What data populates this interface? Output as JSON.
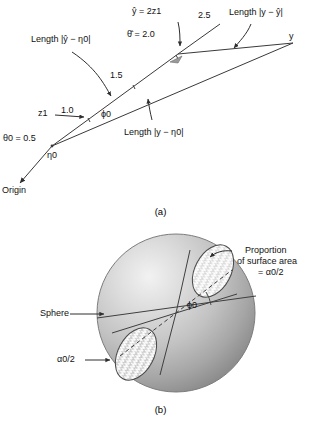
{
  "figure": {
    "panels": [
      {
        "id": "a",
        "caption": "(a)",
        "type": "geometry-diagram",
        "labels": {
          "origin": "Origin",
          "theta0": "θ0 = 0.5",
          "eta0": "η0",
          "z1": "z1",
          "dist_1_0": "1.0",
          "phi0": "ϕ0",
          "dist_1_5": "1.5",
          "dist_2_5": "2.5",
          "yhat_eq": "ŷ = 2z1",
          "thetahat_eq": "θ̂ = 2.0",
          "y": "y",
          "length_yhat_eta0": "Length |ŷ − η0|",
          "length_y_yhat": "Length |y − ŷ|",
          "length_y_eta0": "Length |y − η0|"
        }
      },
      {
        "id": "b",
        "caption": "(b)",
        "type": "sphere-cone-diagram",
        "labels": {
          "sphere": "Sphere",
          "alpha_half_lower": "α0/2",
          "phi0": "ϕ0",
          "proportion_line1": "Proportion",
          "proportion_line2": "of surface area",
          "proportion_line3": "= α0/2"
        }
      }
    ]
  },
  "colors": {
    "line": "#3a3a3a",
    "text": "#111111",
    "sphere_light": "#e9e9e9",
    "sphere_mid": "#bdbdbd",
    "sphere_dark": "#8f8f8f",
    "hatch": "#ffffff",
    "cap_fill": "#d6d6d6",
    "background": "#ffffff"
  }
}
